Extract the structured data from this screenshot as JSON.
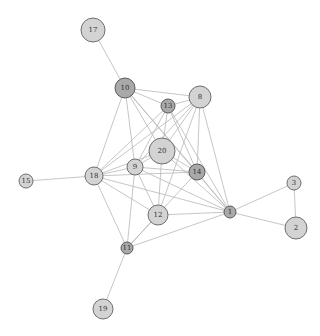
{
  "diagram": {
    "type": "network-graph",
    "colors": {
      "edge": "#b8b8b8",
      "node_light": "#d3d3d3",
      "node_dark": "#a9a9a9",
      "node_stroke": "#6e6e6e",
      "label": "#333333"
    },
    "nodes": [
      {
        "id": "17",
        "x": 93,
        "y": 30,
        "r": 12,
        "shade": "light"
      },
      {
        "id": "10",
        "x": 125,
        "y": 88,
        "r": 10,
        "shade": "dark"
      },
      {
        "id": "13",
        "x": 168,
        "y": 106,
        "r": 7,
        "shade": "dark"
      },
      {
        "id": "8",
        "x": 200,
        "y": 97,
        "r": 11,
        "shade": "light"
      },
      {
        "id": "20",
        "x": 162,
        "y": 151,
        "r": 13,
        "shade": "light"
      },
      {
        "id": "9",
        "x": 135,
        "y": 167,
        "r": 8,
        "shade": "light"
      },
      {
        "id": "14",
        "x": 197,
        "y": 172,
        "r": 8,
        "shade": "dark"
      },
      {
        "id": "18",
        "x": 94,
        "y": 176,
        "r": 9,
        "shade": "light"
      },
      {
        "id": "15",
        "x": 26,
        "y": 181,
        "r": 7,
        "shade": "light"
      },
      {
        "id": "12",
        "x": 158,
        "y": 215,
        "r": 10,
        "shade": "light"
      },
      {
        "id": "1",
        "x": 230,
        "y": 212,
        "r": 6,
        "shade": "dark"
      },
      {
        "id": "3",
        "x": 294,
        "y": 183,
        "r": 7,
        "shade": "light"
      },
      {
        "id": "2",
        "x": 296,
        "y": 228,
        "r": 11,
        "shade": "light"
      },
      {
        "id": "11",
        "x": 127,
        "y": 248,
        "r": 6,
        "shade": "dark"
      },
      {
        "id": "19",
        "x": 103,
        "y": 309,
        "r": 10,
        "shade": "light"
      }
    ],
    "edges": [
      [
        "17",
        "10"
      ],
      [
        "10",
        "13"
      ],
      [
        "10",
        "8"
      ],
      [
        "10",
        "20"
      ],
      [
        "10",
        "9"
      ],
      [
        "10",
        "18"
      ],
      [
        "10",
        "14"
      ],
      [
        "10",
        "1"
      ],
      [
        "13",
        "8"
      ],
      [
        "13",
        "20"
      ],
      [
        "13",
        "9"
      ],
      [
        "13",
        "18"
      ],
      [
        "13",
        "14"
      ],
      [
        "13",
        "1"
      ],
      [
        "8",
        "20"
      ],
      [
        "8",
        "9"
      ],
      [
        "8",
        "18"
      ],
      [
        "8",
        "14"
      ],
      [
        "8",
        "1"
      ],
      [
        "8",
        "12"
      ],
      [
        "20",
        "9"
      ],
      [
        "20",
        "18"
      ],
      [
        "20",
        "12"
      ],
      [
        "20",
        "1"
      ],
      [
        "20",
        "14"
      ],
      [
        "9",
        "18"
      ],
      [
        "9",
        "14"
      ],
      [
        "9",
        "12"
      ],
      [
        "9",
        "11"
      ],
      [
        "9",
        "1"
      ],
      [
        "18",
        "15"
      ],
      [
        "18",
        "14"
      ],
      [
        "18",
        "12"
      ],
      [
        "18",
        "11"
      ],
      [
        "18",
        "1"
      ],
      [
        "14",
        "1"
      ],
      [
        "14",
        "11"
      ],
      [
        "12",
        "1"
      ],
      [
        "12",
        "11"
      ],
      [
        "1",
        "11"
      ],
      [
        "1",
        "3"
      ],
      [
        "1",
        "2"
      ],
      [
        "3",
        "2"
      ],
      [
        "11",
        "19"
      ]
    ]
  }
}
